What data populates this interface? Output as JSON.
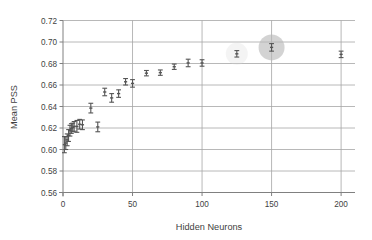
{
  "chart_data": {
    "type": "scatter",
    "title": "",
    "xlabel": "Hidden Neurons",
    "ylabel": "Mean PSS",
    "xlim": [
      0,
      210
    ],
    "ylim": [
      0.56,
      0.72
    ],
    "xticks": [
      0,
      50,
      100,
      150,
      200
    ],
    "yticks": [
      0.56,
      0.58,
      0.6,
      0.62,
      0.64,
      0.66,
      0.68,
      0.7,
      0.72
    ],
    "xtick_labels": [
      "0",
      "50",
      "100",
      "150",
      "200"
    ],
    "ytick_labels": [
      "0.56",
      "0.58",
      "0.60",
      "0.62",
      "0.64",
      "0.66",
      "0.68",
      "0.70",
      "0.72"
    ],
    "grid": "horizontal-and-vertical",
    "legend": "none",
    "errorbars": true,
    "marker": "errorbar-cap",
    "series": [
      {
        "name": "Mean PSS",
        "color": "#555555",
        "points": [
          {
            "x": 1,
            "y": 0.6045,
            "yerr": 0.0075
          },
          {
            "x": 2,
            "y": 0.606,
            "yerr": 0.006
          },
          {
            "x": 3,
            "y": 0.609,
            "yerr": 0.0055
          },
          {
            "x": 4,
            "y": 0.613,
            "yerr": 0.0055
          },
          {
            "x": 5,
            "y": 0.6175,
            "yerr": 0.005
          },
          {
            "x": 6,
            "y": 0.6195,
            "yerr": 0.0045
          },
          {
            "x": 7,
            "y": 0.6205,
            "yerr": 0.004
          },
          {
            "x": 8,
            "y": 0.6215,
            "yerr": 0.0045
          },
          {
            "x": 10,
            "y": 0.6215,
            "yerr": 0.0055
          },
          {
            "x": 12,
            "y": 0.6235,
            "yerr": 0.0045
          },
          {
            "x": 14,
            "y": 0.623,
            "yerr": 0.0045
          },
          {
            "x": 20,
            "y": 0.6385,
            "yerr": 0.0045
          },
          {
            "x": 25,
            "y": 0.621,
            "yerr": 0.0045
          },
          {
            "x": 30,
            "y": 0.6535,
            "yerr": 0.0035
          },
          {
            "x": 35,
            "y": 0.648,
            "yerr": 0.004
          },
          {
            "x": 40,
            "y": 0.652,
            "yerr": 0.0035
          },
          {
            "x": 45,
            "y": 0.663,
            "yerr": 0.003
          },
          {
            "x": 50,
            "y": 0.6615,
            "yerr": 0.0035
          },
          {
            "x": 60,
            "y": 0.671,
            "yerr": 0.0025
          },
          {
            "x": 70,
            "y": 0.6715,
            "yerr": 0.0025
          },
          {
            "x": 80,
            "y": 0.677,
            "yerr": 0.0025
          },
          {
            "x": 90,
            "y": 0.6805,
            "yerr": 0.0035
          },
          {
            "x": 100,
            "y": 0.6805,
            "yerr": 0.003
          },
          {
            "x": 125,
            "y": 0.689,
            "yerr": 0.003
          },
          {
            "x": 150,
            "y": 0.695,
            "yerr": 0.0035
          },
          {
            "x": 200,
            "y": 0.6885,
            "yerr": 0.003
          }
        ]
      }
    ],
    "highlights": [
      {
        "x": 150,
        "y": 0.695,
        "radius_px": 13,
        "color": "#b8b8b8",
        "opacity": 0.62,
        "label": "selected-point-highlight"
      },
      {
        "x": 125,
        "y": 0.689,
        "radius_px": 11,
        "color": "#d8d8d8",
        "opacity": 0.28,
        "label": "secondary-point-highlight"
      }
    ]
  },
  "style": {
    "plot_background": "#ffffff",
    "grid_color": "#a6a6a6",
    "axis_color": "#808080",
    "text_color": "#3f3f3f",
    "marker_color": "#555555"
  }
}
